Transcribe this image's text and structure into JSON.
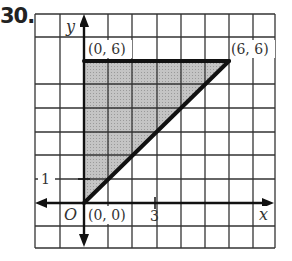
{
  "problem": {
    "number": "30."
  },
  "graph": {
    "x_range": [
      -2,
      8
    ],
    "y_range": [
      -2,
      8
    ],
    "axis_labels": {
      "x": "x",
      "y": "y",
      "origin": "O"
    },
    "tick_labels": {
      "x_tick": "3",
      "y_tick": "1"
    },
    "vertices": [
      {
        "label": "(0, 6)",
        "x": 0,
        "y": 6
      },
      {
        "label": "(6, 6)",
        "x": 6,
        "y": 6
      },
      {
        "label": "(0, 0)",
        "x": 0,
        "y": 0
      }
    ],
    "colors": {
      "shade": "#b8b8b8",
      "line": "#111111",
      "grid": "#333333"
    }
  }
}
